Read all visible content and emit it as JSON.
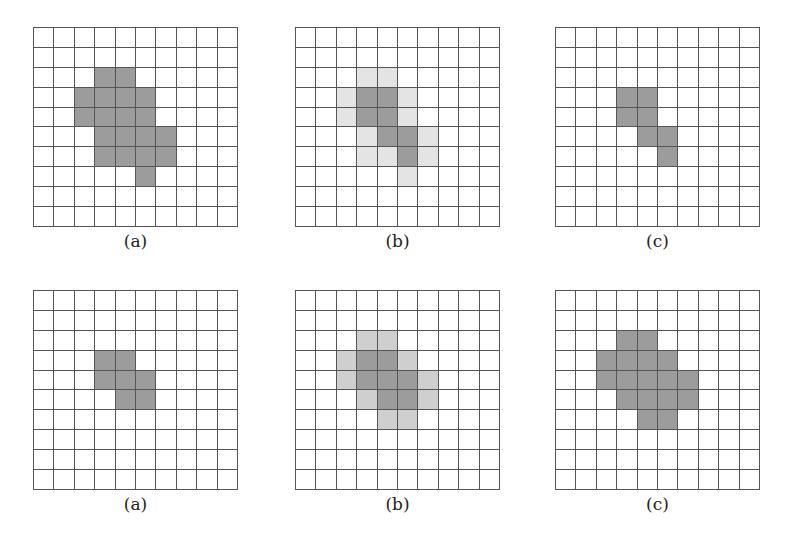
{
  "figure": {
    "colors": {
      "grid_line": "#555555",
      "dark_cell": "#9c9c9c",
      "light_cell_top": "#e4e4e4",
      "light_cell_bottom": "#cfcfcf",
      "empty_cell": "#ffffff"
    },
    "grid_size": [
      10,
      10
    ],
    "rows": [
      {
        "panels": [
          {
            "label": "(a)",
            "dark": [
              [
                2,
                3
              ],
              [
                2,
                4
              ],
              [
                3,
                2
              ],
              [
                3,
                3
              ],
              [
                3,
                4
              ],
              [
                3,
                5
              ],
              [
                4,
                2
              ],
              [
                4,
                3
              ],
              [
                4,
                4
              ],
              [
                4,
                5
              ],
              [
                5,
                3
              ],
              [
                5,
                4
              ],
              [
                5,
                5
              ],
              [
                5,
                6
              ],
              [
                6,
                3
              ],
              [
                6,
                4
              ],
              [
                6,
                5
              ],
              [
                6,
                6
              ],
              [
                7,
                5
              ]
            ],
            "light": []
          },
          {
            "label": "(b)",
            "dark": [
              [
                3,
                3
              ],
              [
                3,
                4
              ],
              [
                4,
                3
              ],
              [
                4,
                4
              ],
              [
                5,
                4
              ],
              [
                5,
                5
              ],
              [
                6,
                5
              ]
            ],
            "light": [
              [
                2,
                3
              ],
              [
                2,
                4
              ],
              [
                3,
                2
              ],
              [
                3,
                5
              ],
              [
                4,
                2
              ],
              [
                4,
                5
              ],
              [
                5,
                3
              ],
              [
                5,
                6
              ],
              [
                6,
                3
              ],
              [
                6,
                4
              ],
              [
                6,
                6
              ],
              [
                7,
                5
              ]
            ]
          },
          {
            "label": "(c)",
            "dark": [
              [
                3,
                3
              ],
              [
                3,
                4
              ],
              [
                4,
                3
              ],
              [
                4,
                4
              ],
              [
                5,
                4
              ],
              [
                5,
                5
              ],
              [
                6,
                5
              ]
            ],
            "light": []
          }
        ]
      },
      {
        "panels": [
          {
            "label": "(a)",
            "dark": [
              [
                3,
                3
              ],
              [
                3,
                4
              ],
              [
                4,
                3
              ],
              [
                4,
                4
              ],
              [
                4,
                5
              ],
              [
                5,
                4
              ],
              [
                5,
                5
              ]
            ],
            "light": []
          },
          {
            "label": "(b)",
            "dark": [
              [
                3,
                3
              ],
              [
                3,
                4
              ],
              [
                4,
                3
              ],
              [
                4,
                4
              ],
              [
                4,
                5
              ],
              [
                5,
                4
              ],
              [
                5,
                5
              ]
            ],
            "light": [
              [
                2,
                3
              ],
              [
                2,
                4
              ],
              [
                3,
                2
              ],
              [
                3,
                5
              ],
              [
                4,
                2
              ],
              [
                4,
                6
              ],
              [
                5,
                3
              ],
              [
                5,
                6
              ],
              [
                6,
                4
              ],
              [
                6,
                5
              ]
            ]
          },
          {
            "label": "(c)",
            "dark": [
              [
                2,
                3
              ],
              [
                2,
                4
              ],
              [
                3,
                2
              ],
              [
                3,
                3
              ],
              [
                3,
                4
              ],
              [
                3,
                5
              ],
              [
                4,
                2
              ],
              [
                4,
                3
              ],
              [
                4,
                4
              ],
              [
                4,
                5
              ],
              [
                4,
                6
              ],
              [
                5,
                3
              ],
              [
                5,
                4
              ],
              [
                5,
                5
              ],
              [
                5,
                6
              ],
              [
                6,
                4
              ],
              [
                6,
                5
              ]
            ],
            "light": []
          }
        ]
      }
    ]
  }
}
